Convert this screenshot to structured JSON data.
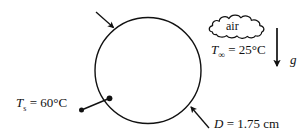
{
  "figure": {
    "type": "heat-transfer-schematic",
    "background_color": "#ffffff",
    "stroke_color": "#111111",
    "sphere": {
      "label_name": "sphere-outline",
      "center_x": 148,
      "center_y": 70,
      "radius": 53
    },
    "labels": {
      "air": "air",
      "ambient_temp_symbol": "T",
      "ambient_temp_subscript": "∞",
      "ambient_temp_value": "= 25°C",
      "ambient_temp_full": "T∞ = 25°C",
      "gravity_symbol": "g",
      "surface_temp_symbol": "T",
      "surface_temp_subscript": "s",
      "surface_temp_value": "= 60°C",
      "surface_temp_full": "Ts = 60°C",
      "diameter_symbol": "D",
      "diameter_value": "= 1.75 cm",
      "diameter_full": "D = 1.75 cm"
    },
    "values": {
      "ambient_temperature_c": 25,
      "surface_temperature_c": 60,
      "diameter_cm": 1.75
    },
    "annotations": [
      {
        "name": "incoming-flow-arrow",
        "kind": "arrow",
        "from": [
          96,
          12
        ],
        "to": [
          115,
          29
        ]
      },
      {
        "name": "surface-temp-leader",
        "kind": "leader-line-dots",
        "from": [
          81,
          110
        ],
        "to": [
          110,
          98
        ]
      },
      {
        "name": "diameter-leader-arrow",
        "kind": "arrow",
        "from": [
          208,
          127
        ],
        "to": [
          190,
          106
        ]
      },
      {
        "name": "gravity-arrow",
        "kind": "arrow",
        "from": [
          277,
          29
        ],
        "to": [
          277,
          68
        ]
      }
    ]
  }
}
